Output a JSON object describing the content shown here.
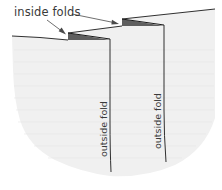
{
  "diagram": {
    "labels": {
      "inside_folds": "inside folds",
      "outside_fold_left": "outside fold",
      "outside_fold_right": "outside fold"
    },
    "colors": {
      "fabric_fill": "#f0f0f0",
      "fold_shadow": "#5f5f5f",
      "line": "#1a1a1a",
      "text": "#3a3a3a",
      "arrow": "#4a4a4a"
    },
    "elements": [
      {
        "type": "panel",
        "name": "fabric-sheet"
      },
      {
        "type": "fold",
        "kind": "inside",
        "count": 2
      },
      {
        "type": "fold",
        "kind": "outside",
        "count": 2
      },
      {
        "type": "arrow",
        "count": 2,
        "target": "inside folds"
      }
    ]
  }
}
